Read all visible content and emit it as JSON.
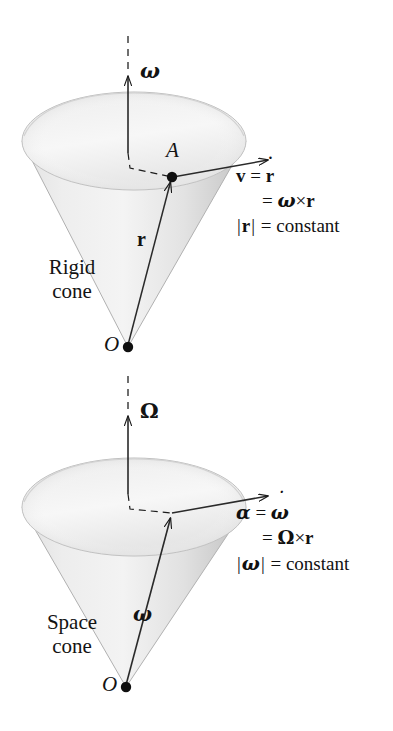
{
  "figure": {
    "background_color": "#ffffff",
    "ink_color": "#131313",
    "cone_fill_light": "#f2f2f2",
    "cone_fill_mid": "#d9d9d9",
    "cone_fill_dark": "#bcbcbc"
  },
  "panels": [
    {
      "id": "rigid",
      "cone_label_line1": "Rigid",
      "cone_label_line2": "cone",
      "axis_symbol": "ω",
      "apex_label": "O",
      "point_label": "A",
      "radius_vector_label": "r",
      "velocity_vector_label": "v",
      "equations": [
        {
          "lhs": "v",
          "op": "=",
          "rhs_base": "r",
          "rhs_accent": "˙",
          "raw": "v = ṙ"
        },
        {
          "lhs": "",
          "op": "=",
          "rhs": "ω × r",
          "raw": "= ω × r"
        },
        {
          "lhs": "|r|",
          "op": "=",
          "rhs": "constant",
          "raw": "|r| = constant"
        }
      ]
    },
    {
      "id": "space",
      "cone_label_line1": "Space",
      "cone_label_line2": "cone",
      "axis_symbol": "Ω",
      "apex_label": "O",
      "point_label": "",
      "radius_vector_label": "ω",
      "velocity_vector_label": "α",
      "equations": [
        {
          "lhs": "α",
          "op": "=",
          "rhs_base": "ω",
          "rhs_accent": "˙",
          "raw": "α = ω̇"
        },
        {
          "lhs": "",
          "op": "=",
          "rhs": "Ω × r",
          "raw": "= Ω × r"
        },
        {
          "lhs": "|ω|",
          "op": "=",
          "rhs": "constant",
          "raw": "|ω| = constant"
        }
      ]
    }
  ],
  "symbols": {
    "times": "×",
    "equals": "=",
    "vbar": "|",
    "dot_accent": "˙",
    "omega_lower": "ω",
    "omega_upper": "Ω",
    "alpha": "α",
    "constant_word": "constant"
  }
}
